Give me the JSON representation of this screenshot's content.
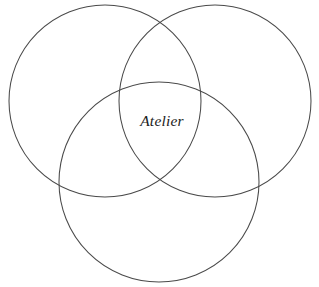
{
  "diagram": {
    "type": "venn",
    "title": "",
    "background_color": "#ffffff",
    "stroke_color": "#4a4a4a",
    "stroke_width": 1.05,
    "text_color": "#1c1c1c",
    "canvas": {
      "width": 319,
      "height": 287
    },
    "center_label": "Atelier",
    "center_label_position": {
      "x": 162,
      "y": 126
    },
    "circles": [
      {
        "name": "top-left-circle",
        "cx": 105,
        "cy": 101,
        "r": 96,
        "label": ""
      },
      {
        "name": "top-right-circle",
        "cx": 215,
        "cy": 101,
        "r": 96,
        "label": ""
      },
      {
        "name": "bottom-circle",
        "cx": 159,
        "cy": 182,
        "r": 100,
        "label": ""
      }
    ]
  }
}
